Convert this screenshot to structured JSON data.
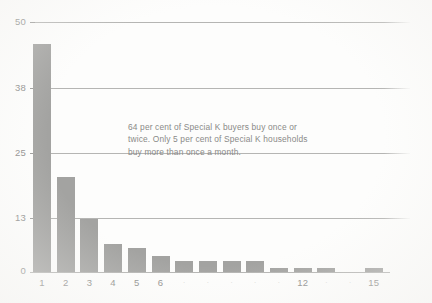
{
  "chart_data": {
    "type": "bar",
    "title": "",
    "subtitle": "",
    "xlabel": "",
    "ylabel": "",
    "categories": [
      "1",
      "2",
      "3",
      "4",
      "5",
      "6",
      "7",
      "8",
      "9",
      "10",
      "11",
      "12",
      "13",
      "14",
      "15"
    ],
    "values": [
      45.6,
      19.0,
      10.6,
      5.6,
      4.8,
      3.2,
      2.2,
      2.2,
      2.2,
      2.2,
      0.9,
      0.9,
      0.9,
      0.0,
      0.8
    ],
    "series": [
      {
        "name": "Special K purchase occasions",
        "values": [
          45.6,
          19.0,
          10.6,
          5.6,
          4.8,
          3.2,
          2.2,
          2.2,
          2.2,
          2.2,
          0.9,
          0.9,
          0.9,
          0.0,
          0.8
        ]
      }
    ],
    "ylim": [
      0,
      50
    ],
    "xlim_categories": 15,
    "yticks": [
      0,
      13,
      25,
      38,
      50
    ],
    "ytick_labels": [
      "0",
      "13",
      "25",
      "38",
      "50"
    ],
    "xtick_labels_visible": [
      "1",
      "2",
      "3",
      "4",
      "5",
      "6",
      "12",
      "15"
    ],
    "xtick_labels_faint": [
      "7",
      "8",
      "9",
      "10",
      "11",
      "13",
      "14"
    ],
    "grid": true,
    "grid_axis": "y",
    "legend": false,
    "legend_position": "none",
    "bar_color": "#a3a3a1",
    "grid_color": "#a9a9a7",
    "text_color": "#8d8d8b",
    "background_color": "#fdfdfc",
    "annotations": [
      {
        "name": "insight-callout",
        "text": "64 per cent of Special K buyers buy once or twice. Only 5 per cent of Special K households buy more than once a month."
      }
    ]
  },
  "axes": {
    "y": {
      "ticks": [
        {
          "label": "50",
          "value": 50
        },
        {
          "label": "38",
          "value": 38
        },
        {
          "label": "25",
          "value": 25
        },
        {
          "label": "13",
          "value": 13
        },
        {
          "label": "0",
          "value": 0
        }
      ]
    },
    "x": {
      "ticks": [
        {
          "label": "1",
          "faint": false
        },
        {
          "label": "2",
          "faint": false
        },
        {
          "label": "3",
          "faint": false
        },
        {
          "label": "4",
          "faint": false
        },
        {
          "label": "5",
          "faint": false
        },
        {
          "label": "6",
          "faint": false
        },
        {
          "label": "7",
          "faint": true
        },
        {
          "label": "8",
          "faint": true
        },
        {
          "label": "9",
          "faint": true
        },
        {
          "label": "10",
          "faint": true
        },
        {
          "label": "11",
          "faint": true
        },
        {
          "label": "12",
          "faint": false
        },
        {
          "label": "13",
          "faint": true
        },
        {
          "label": "14",
          "faint": true
        },
        {
          "label": "15",
          "faint": false
        }
      ]
    }
  },
  "annotation": {
    "text": "64 per cent of Special K buyers buy once or twice. Only 5 per cent of Special K households buy more than once a month."
  }
}
